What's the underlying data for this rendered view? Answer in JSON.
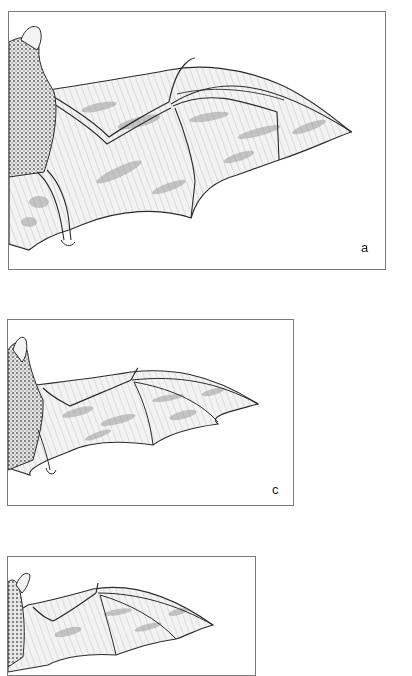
{
  "figure": {
    "panels": [
      {
        "id": "a",
        "label": "a",
        "subject": "bat-wing-broad",
        "frame": {
          "x": 8,
          "y": 11,
          "w": 378,
          "h": 259
        }
      },
      {
        "id": "c",
        "label": "c",
        "subject": "bat-wing-narrow",
        "frame": {
          "x": 7,
          "y": 319,
          "w": 287,
          "h": 187
        }
      },
      {
        "id": "b",
        "label": "",
        "subject": "bat-wing-small",
        "frame": {
          "x": 7,
          "y": 556,
          "w": 249,
          "h": 120
        }
      }
    ],
    "colors": {
      "frame": "#7a7a7a",
      "ink": "#2a2a2a",
      "shade": "#9a9a9a",
      "background": "#ffffff"
    }
  }
}
